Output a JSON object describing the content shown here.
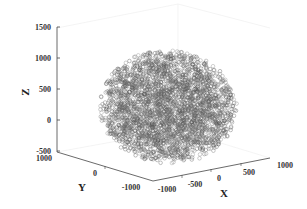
{
  "chart_data": {
    "type": "scatter",
    "dimensions": 3,
    "title": "",
    "xlabel": "X",
    "ylabel": "Y",
    "zlabel": "Z",
    "marker": "open-circle",
    "marker_color": "#555555",
    "grid": true,
    "legend": null,
    "xlim": [
      -1000,
      1000
    ],
    "ylim": [
      -1000,
      1000
    ],
    "zlim": [
      -500,
      1500
    ],
    "xticks": [
      "-1000",
      "-500",
      "0",
      "500",
      "1000"
    ],
    "yticks": [
      "-1000",
      "0",
      "1000"
    ],
    "zticks": [
      "-500",
      "0",
      "500",
      "1000",
      "1500"
    ],
    "distribution": {
      "shape": "sphere",
      "center": {
        "x": 0,
        "y": 0,
        "z": 500
      },
      "radius": 1000,
      "approx_point_count": 3000
    }
  },
  "axes": {
    "x": {
      "label": "X",
      "ticks": [
        "-1000",
        "-500",
        "0",
        "500",
        "1000"
      ]
    },
    "y": {
      "label": "Y",
      "ticks": [
        "-1000",
        "0",
        "1000"
      ]
    },
    "z": {
      "label": "Z",
      "ticks": [
        "-500",
        "0",
        "500",
        "1000",
        "1500"
      ]
    }
  }
}
